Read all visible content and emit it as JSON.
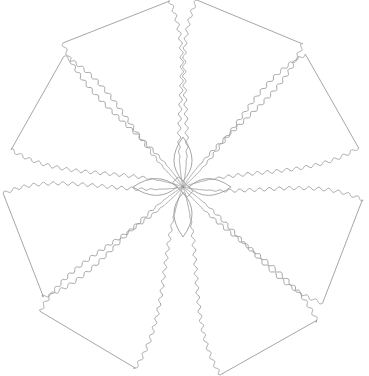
{
  "artwork": {
    "subject": "flower line drawing",
    "width": 369,
    "height": 376,
    "background": "#ffffff",
    "stroke_color": "#9c9c9c",
    "stroke_width": 0.9,
    "center": [
      183,
      187
    ],
    "petals": [
      {
        "name": "upper-left-outer",
        "angle": -112,
        "length": 178,
        "width": 62,
        "wave_amp": 1.6,
        "waves": 26
      },
      {
        "name": "upper-left-inner",
        "angle": -150,
        "length": 168,
        "width": 58,
        "wave_amp": 1.6,
        "waves": 24
      },
      {
        "name": "upper-right-outer",
        "angle": -68,
        "length": 178,
        "width": 62,
        "wave_amp": 1.6,
        "waves": 26
      },
      {
        "name": "upper-right-inner",
        "angle": -30,
        "length": 172,
        "width": 58,
        "wave_amp": 1.6,
        "waves": 24
      },
      {
        "name": "lower-left-outer",
        "angle": 160,
        "length": 170,
        "width": 60,
        "wave_amp": 1.6,
        "waves": 24
      },
      {
        "name": "lower-left-inner",
        "angle": 122,
        "length": 180,
        "width": 60,
        "wave_amp": 1.6,
        "waves": 26
      },
      {
        "name": "lower-right-outer",
        "angle": 22,
        "length": 172,
        "width": 60,
        "wave_amp": 1.6,
        "waves": 24
      },
      {
        "name": "lower-right-inner",
        "angle": 62,
        "length": 182,
        "width": 60,
        "wave_amp": 1.6,
        "waves": 26
      }
    ],
    "inner_leaves": [
      {
        "name": "leaf-top",
        "angle": -90,
        "length": 50,
        "width": 14
      },
      {
        "name": "leaf-right",
        "angle": 0,
        "length": 48,
        "width": 13
      },
      {
        "name": "leaf-bottom",
        "angle": 90,
        "length": 50,
        "width": 14
      },
      {
        "name": "leaf-left",
        "angle": 180,
        "length": 50,
        "width": 13
      }
    ]
  }
}
